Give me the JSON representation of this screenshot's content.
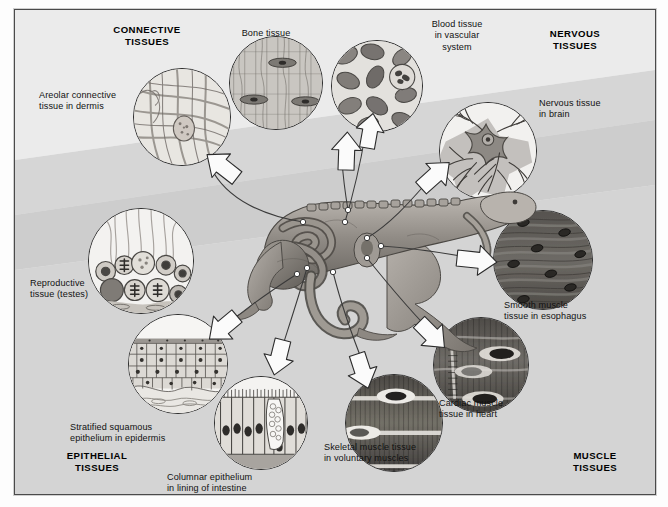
{
  "figure": {
    "kind": "tissue-types-overview-diagram",
    "background_color": "#e2e2e2",
    "band_color": "#d2d2d2",
    "frame_color": "#4a4a4a"
  },
  "headers": [
    {
      "id": "connective",
      "text": "CONNECTIVE\nTISSUES",
      "x": 62,
      "y": 14,
      "w": 140
    },
    {
      "id": "nervous",
      "text": "NERVOUS\nTISSUES",
      "x": 500,
      "y": 18,
      "w": 120
    },
    {
      "id": "epithelial",
      "text": "EPITHELIAL\nTISSUES",
      "x": 22,
      "y": 440,
      "w": 120
    },
    {
      "id": "muscle",
      "text": "MUSCLE\nTISSUES",
      "x": 520,
      "y": 440,
      "w": 120
    }
  ],
  "callouts": [
    {
      "id": "areolar",
      "text": "Areolar connective\ntissue in dermis",
      "x": 24,
      "y": 80,
      "align": "left"
    },
    {
      "id": "bone",
      "text": "Bone tissue",
      "x": 196,
      "y": 18,
      "align": "center",
      "w": 110
    },
    {
      "id": "blood",
      "text": "Blood tissue\nin vascular\nsystem",
      "x": 383,
      "y": 9,
      "align": "center",
      "w": 118
    },
    {
      "id": "nerve",
      "text": "Nervous tissue\nin brain",
      "x": 524,
      "y": 88,
      "align": "left"
    },
    {
      "id": "smooth",
      "text": "Smooth muscle\ntissue in esophagus",
      "x": 489,
      "y": 290,
      "align": "left"
    },
    {
      "id": "cardiac",
      "text": "Cardiac muscle\ntissue in heart",
      "x": 424,
      "y": 388,
      "align": "left"
    },
    {
      "id": "skeletal",
      "text": "Skeletal muscle tissue\nin voluntary muscles",
      "x": 309,
      "y": 432,
      "align": "left"
    },
    {
      "id": "columnar",
      "text": "Columnar epithelium\nin lining of intestine",
      "x": 152,
      "y": 462,
      "align": "left"
    },
    {
      "id": "stratified",
      "text": "Stratified squamous\nepithelium in epidermis",
      "x": 55,
      "y": 412,
      "align": "left"
    },
    {
      "id": "reproductive",
      "text": "Reproductive\ntissue (testes)",
      "x": 15,
      "y": 268,
      "align": "left"
    }
  ],
  "micrographs": [
    {
      "id": "areolar",
      "name": "areolar-connective-tissue-circle",
      "x": 118,
      "y": 58,
      "d": 96,
      "art": "areolar"
    },
    {
      "id": "bone",
      "name": "bone-tissue-circle",
      "x": 214,
      "y": 26,
      "d": 92,
      "art": "bone"
    },
    {
      "id": "blood",
      "name": "blood-tissue-circle",
      "x": 316,
      "y": 30,
      "d": 90,
      "art": "blood"
    },
    {
      "id": "nerve",
      "name": "nervous-tissue-circle",
      "x": 424,
      "y": 92,
      "d": 96,
      "art": "nerve"
    },
    {
      "id": "smooth",
      "name": "smooth-muscle-tissue-circle",
      "x": 478,
      "y": 200,
      "d": 98,
      "art": "smooth"
    },
    {
      "id": "cardiac",
      "name": "cardiac-muscle-tissue-circle",
      "x": 418,
      "y": 307,
      "d": 94,
      "art": "cardiac"
    },
    {
      "id": "skeletal",
      "name": "skeletal-muscle-tissue-circle",
      "x": 330,
      "y": 364,
      "d": 96,
      "art": "skeletal"
    },
    {
      "id": "columnar",
      "name": "columnar-epithelium-circle",
      "x": 199,
      "y": 366,
      "d": 92,
      "art": "columnar"
    },
    {
      "id": "stratified",
      "name": "stratified-squamous-epithelium-circle",
      "x": 113,
      "y": 304,
      "d": 98,
      "art": "stratified"
    },
    {
      "id": "reproductive",
      "name": "reproductive-tissue-circle",
      "x": 73,
      "y": 198,
      "d": 104,
      "art": "reproductive"
    }
  ],
  "arrows": [
    {
      "id": "to-areolar",
      "from": [
        288,
        212
      ],
      "to": [
        208,
        155
      ]
    },
    {
      "id": "to-bone",
      "from": [
        333,
        200
      ],
      "to": [
        327,
        146
      ]
    },
    {
      "id": "to-blood",
      "from": [
        330,
        212
      ],
      "to": [
        348,
        123
      ]
    },
    {
      "id": "to-nerve",
      "from": [
        352,
        228
      ],
      "to": [
        416,
        166
      ]
    },
    {
      "id": "to-smooth",
      "from": [
        366,
        236
      ],
      "to": [
        470,
        250
      ]
    },
    {
      "id": "to-cardiac",
      "from": [
        352,
        248
      ],
      "to": [
        425,
        330
      ]
    },
    {
      "id": "to-skeletal",
      "from": [
        318,
        262
      ],
      "to": [
        350,
        356
      ]
    },
    {
      "id": "to-columnar",
      "from": [
        292,
        258
      ],
      "to": [
        262,
        352
      ]
    },
    {
      "id": "to-stratified",
      "from": [
        282,
        264
      ],
      "to": [
        205,
        318
      ]
    }
  ],
  "leaders": [
    {
      "id": "leader-skin-dorsal",
      "dot": [
        288,
        212
      ]
    },
    {
      "id": "leader-bone-spine",
      "dot": [
        333,
        200
      ]
    },
    {
      "id": "leader-vessel",
      "dot": [
        330,
        212
      ]
    },
    {
      "id": "leader-brain",
      "dot": [
        352,
        228
      ]
    },
    {
      "id": "leader-esophagus",
      "dot": [
        366,
        236
      ]
    },
    {
      "id": "leader-heart",
      "dot": [
        352,
        248
      ]
    },
    {
      "id": "leader-muscle",
      "dot": [
        318,
        262
      ]
    },
    {
      "id": "leader-intestine",
      "dot": [
        292,
        258
      ]
    },
    {
      "id": "leader-testis",
      "dot": [
        282,
        264
      ]
    }
  ]
}
